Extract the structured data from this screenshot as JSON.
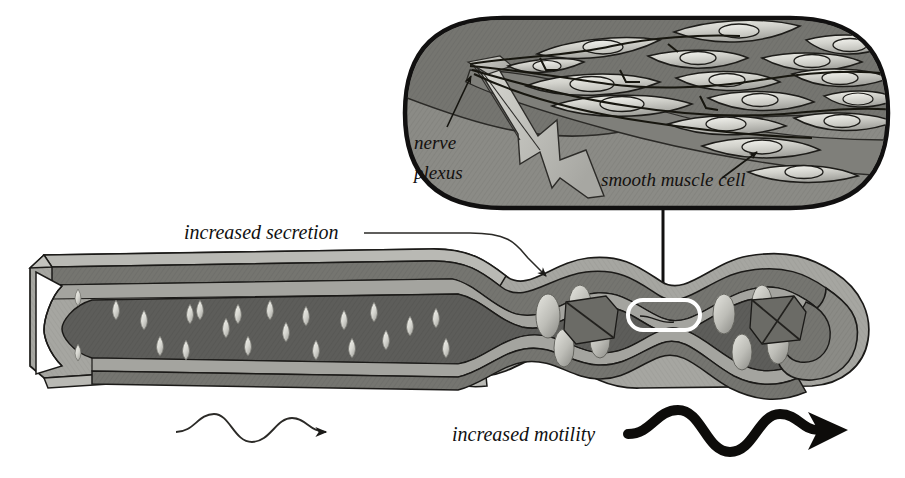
{
  "figure": {
    "title_visible": false,
    "kind": "biological-diagram"
  },
  "labels": {
    "increased_secretion": "increased secretion",
    "increased_motility": "increased motility",
    "nerve_plexus_line1": "nerve",
    "nerve_plexus_line2": "plexus",
    "smooth_muscle_cell": "smooth muscle cell"
  },
  "icons": {
    "secretion_leader": "leader-line-with-arrowhead",
    "inset_connector": "callout-connector-line",
    "callout_box": "rounded-rect-highlight",
    "thin_wave_arrow": "wavy-arrow-thin",
    "bold_wave_arrow": "wavy-arrow-bold",
    "lightning": "nerve-bundle-lightning",
    "nerve_arrow": "pointer-arrow",
    "muscle_arrow": "pointer-arrow"
  },
  "colors": {
    "background": "#ffffff",
    "outline": "#1b1a18",
    "serosa_light": "#a9a9a4",
    "muscle_mid": "#6e6e6a",
    "submucosa": "#8d8d88",
    "lumen_dark": "#5a5a57",
    "mucosa_dark": "#4d4d4a",
    "inset_fill": "#8b8b86",
    "inset_upper": "#7b7b76",
    "cell_light": "#d3d3cd",
    "nucleus": "#e8e8e2",
    "droplet": "#dcdcd6",
    "bolus": "#c9c9c3",
    "ink": "#111111"
  },
  "inset": {
    "shape": "stadium",
    "muscle_cell_count": 16,
    "nerve_fiber_count": 5,
    "layer_note": "smooth muscle layer over connective tissue with nerve plexus"
  },
  "tube": {
    "left_end": "cut-open cross-section",
    "right_end": "closed rounded cap",
    "droplet_count": 22,
    "bolus_count": 8,
    "constriction_count": 3,
    "segments": [
      "relaxed dilated segment",
      "contracted peristaltic segment"
    ]
  }
}
